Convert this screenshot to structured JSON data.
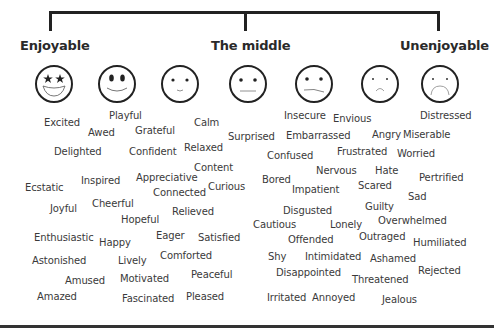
{
  "diagram": {
    "headings": {
      "left": "Enjoyable",
      "middle": "The middle",
      "right": "Unenjoyable"
    },
    "faces": [
      {
        "name": "star-eyes-big-grin-face",
        "x": 34
      },
      {
        "name": "big-smile-face",
        "x": 97
      },
      {
        "name": "slight-smile-face",
        "x": 160
      },
      {
        "name": "neutral-face",
        "x": 228
      },
      {
        "name": "slight-frown-face",
        "x": 294
      },
      {
        "name": "small-frown-face",
        "x": 360
      },
      {
        "name": "big-frown-face",
        "x": 420
      }
    ],
    "words": [
      {
        "text": "Playful",
        "x": 109,
        "y": 110
      },
      {
        "text": "Excited",
        "x": 44,
        "y": 117
      },
      {
        "text": "Awed",
        "x": 88,
        "y": 127
      },
      {
        "text": "Grateful",
        "x": 135,
        "y": 125
      },
      {
        "text": "Calm",
        "x": 194,
        "y": 117
      },
      {
        "text": "Delighted",
        "x": 54,
        "y": 146
      },
      {
        "text": "Confident",
        "x": 129,
        "y": 146
      },
      {
        "text": "Relaxed",
        "x": 184,
        "y": 142
      },
      {
        "text": "Surprised",
        "x": 228,
        "y": 131
      },
      {
        "text": "Content",
        "x": 194,
        "y": 162
      },
      {
        "text": "Inspired",
        "x": 81,
        "y": 175
      },
      {
        "text": "Appreciative",
        "x": 136,
        "y": 172
      },
      {
        "text": "Curious",
        "x": 208,
        "y": 181
      },
      {
        "text": "Ecstatic",
        "x": 25,
        "y": 182
      },
      {
        "text": "Connected",
        "x": 153,
        "y": 187
      },
      {
        "text": "Joyful",
        "x": 50,
        "y": 203
      },
      {
        "text": "Cheerful",
        "x": 92,
        "y": 198
      },
      {
        "text": "Relieved",
        "x": 172,
        "y": 206
      },
      {
        "text": "Hopeful",
        "x": 121,
        "y": 214
      },
      {
        "text": "Enthusiastic",
        "x": 34,
        "y": 232
      },
      {
        "text": "Happy",
        "x": 99,
        "y": 237
      },
      {
        "text": "Eager",
        "x": 156,
        "y": 230
      },
      {
        "text": "Satisfied",
        "x": 198,
        "y": 232
      },
      {
        "text": "Astonished",
        "x": 32,
        "y": 255
      },
      {
        "text": "Lively",
        "x": 118,
        "y": 255
      },
      {
        "text": "Comforted",
        "x": 160,
        "y": 250
      },
      {
        "text": "Amused",
        "x": 65,
        "y": 275
      },
      {
        "text": "Motivated",
        "x": 120,
        "y": 273
      },
      {
        "text": "Peaceful",
        "x": 191,
        "y": 269
      },
      {
        "text": "Amazed",
        "x": 37,
        "y": 291
      },
      {
        "text": "Fascinated",
        "x": 122,
        "y": 293
      },
      {
        "text": "Pleased",
        "x": 186,
        "y": 291
      },
      {
        "text": "Insecure",
        "x": 284,
        "y": 110
      },
      {
        "text": "Envious",
        "x": 333,
        "y": 113
      },
      {
        "text": "Distressed",
        "x": 420,
        "y": 110
      },
      {
        "text": "Embarrassed",
        "x": 286,
        "y": 130
      },
      {
        "text": "Angry",
        "x": 372,
        "y": 129
      },
      {
        "text": "Miserable",
        "x": 403,
        "y": 129
      },
      {
        "text": "Confused",
        "x": 267,
        "y": 150
      },
      {
        "text": "Frustrated",
        "x": 337,
        "y": 146
      },
      {
        "text": "Worried",
        "x": 397,
        "y": 148
      },
      {
        "text": "Nervous",
        "x": 316,
        "y": 165
      },
      {
        "text": "Hate",
        "x": 375,
        "y": 165
      },
      {
        "text": "Bored",
        "x": 262,
        "y": 174
      },
      {
        "text": "Pertrified",
        "x": 419,
        "y": 172
      },
      {
        "text": "Impatient",
        "x": 292,
        "y": 184
      },
      {
        "text": "Scared",
        "x": 358,
        "y": 180
      },
      {
        "text": "Sad",
        "x": 408,
        "y": 191
      },
      {
        "text": "Disgusted",
        "x": 283,
        "y": 205
      },
      {
        "text": "Guilty",
        "x": 365,
        "y": 201
      },
      {
        "text": "Cautious",
        "x": 253,
        "y": 219
      },
      {
        "text": "Lonely",
        "x": 330,
        "y": 219
      },
      {
        "text": "Overwhelmed",
        "x": 378,
        "y": 215
      },
      {
        "text": "Offended",
        "x": 288,
        "y": 234
      },
      {
        "text": "Outraged",
        "x": 359,
        "y": 231
      },
      {
        "text": "Humiliated",
        "x": 413,
        "y": 237
      },
      {
        "text": "Shy",
        "x": 268,
        "y": 251
      },
      {
        "text": "Intimidated",
        "x": 305,
        "y": 251
      },
      {
        "text": "Ashamed",
        "x": 370,
        "y": 253
      },
      {
        "text": "Disappointed",
        "x": 276,
        "y": 267
      },
      {
        "text": "Rejected",
        "x": 418,
        "y": 265
      },
      {
        "text": "Threatened",
        "x": 352,
        "y": 274
      },
      {
        "text": "Irritated",
        "x": 267,
        "y": 292
      },
      {
        "text": "Annoyed",
        "x": 312,
        "y": 292
      },
      {
        "text": "Jealous",
        "x": 382,
        "y": 294
      }
    ],
    "colors": {
      "text": "#3a3a3a",
      "lines": "#222222",
      "background": "#ffffff"
    }
  }
}
